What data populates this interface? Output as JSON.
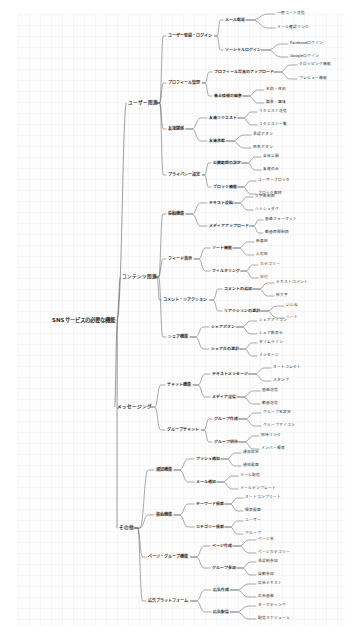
{
  "document": {
    "type": "mindmap",
    "title": "SNSサービスの必要な機能",
    "background_color": "#fdfdfd",
    "line_color": "#4a4a4a",
    "text_color": "#2b2b2b"
  },
  "root": {
    "label": "SNSサービスの必要な機能",
    "x": 52,
    "y": 321
  },
  "branches": [
    {
      "id": "user",
      "label": "ユーザー関連",
      "x": 128,
      "y": 103,
      "children": [
        {
          "label": "ユーザー登録・ログイン",
          "x": 168,
          "y": 36,
          "children": [
            {
              "label": "メール認証",
              "x": 225,
              "y": 20,
              "children": [
                {
                  "label": "一時コード送信",
                  "x": 277,
                  "y": 14
                },
                {
                  "label": "メール確認リンク",
                  "x": 277,
                  "y": 28
                }
              ]
            },
            {
              "label": "ソーシャルログイン",
              "x": 225,
              "y": 50,
              "children": [
                {
                  "label": "Facebookログイン",
                  "x": 290,
                  "y": 44
                },
                {
                  "label": "Googleログイン",
                  "x": 290,
                  "y": 57
                }
              ]
            }
          ]
        },
        {
          "label": "プロフィール管理",
          "x": 168,
          "y": 83,
          "children": [
            {
              "label": "プロフィール写真のアップロード",
              "x": 214,
              "y": 72,
              "children": [
                {
                  "label": "クロッピング機能",
                  "x": 299,
                  "y": 65
                },
                {
                  "label": "プレビュー機能",
                  "x": 299,
                  "y": 79
                }
              ]
            },
            {
              "label": "基本情報の編集",
              "x": 214,
              "y": 96,
              "children": [
                {
                  "label": "名前・性別",
                  "x": 266,
                  "y": 90
                },
                {
                  "label": "職業・趣味",
                  "x": 266,
                  "y": 103
                }
              ]
            }
          ]
        },
        {
          "label": "友達関係",
          "x": 168,
          "y": 129,
          "children": [
            {
              "label": "友達リクエスト",
              "x": 209,
              "y": 118,
              "children": [
                {
                  "label": "リクエスト送信",
                  "x": 259,
                  "y": 112
                },
                {
                  "label": "リクエスト一覧",
                  "x": 259,
                  "y": 125
                }
              ]
            },
            {
              "label": "友達承認",
              "x": 209,
              "y": 141,
              "children": [
                {
                  "label": "承認ボタン",
                  "x": 253,
                  "y": 135
                },
                {
                  "label": "拒否ボタン",
                  "x": 253,
                  "y": 148
                }
              ]
            }
          ]
        },
        {
          "label": "プライバシー設定",
          "x": 168,
          "y": 175,
          "children": [
            {
              "label": "公開範囲の設定",
              "x": 213,
              "y": 163,
              "children": [
                {
                  "label": "全体公開",
                  "x": 263,
                  "y": 157
                },
                {
                  "label": "友達のみ",
                  "x": 263,
                  "y": 170
                }
              ]
            },
            {
              "label": "ブロック機能",
              "x": 213,
              "y": 187,
              "children": [
                {
                  "label": "ユーザーブロック",
                  "x": 258,
                  "y": 181
                },
                {
                  "label": "ブロック解除",
                  "x": 258,
                  "y": 194
                }
              ]
            }
          ]
        }
      ]
    },
    {
      "id": "content",
      "label": "コンテンツ関連",
      "x": 122,
      "y": 277,
      "children": [
        {
          "label": "投稿機能",
          "x": 168,
          "y": 214,
          "children": [
            {
              "label": "テキスト投稿",
              "x": 209,
              "y": 203,
              "children": [
                {
                  "label": "文字数制限",
                  "x": 255,
                  "y": 197
                },
                {
                  "label": "ハッシュタグ",
                  "x": 255,
                  "y": 210
                }
              ]
            },
            {
              "label": "メディアアップロード",
              "x": 209,
              "y": 226,
              "children": [
                {
                  "label": "画像フォーマット",
                  "x": 265,
                  "y": 220
                },
                {
                  "label": "動画時間制限",
                  "x": 265,
                  "y": 233
                }
              ]
            }
          ]
        },
        {
          "label": "フィード表示",
          "x": 168,
          "y": 259,
          "children": [
            {
              "label": "ソート機能",
              "x": 212,
              "y": 248,
              "children": [
                {
                  "label": "新着順",
                  "x": 256,
                  "y": 242
                },
                {
                  "label": "人気順",
                  "x": 256,
                  "y": 255
                }
              ]
            },
            {
              "label": "フィルタリング",
              "x": 212,
              "y": 271,
              "children": [
                {
                  "label": "カテゴリー",
                  "x": 260,
                  "y": 265
                },
                {
                  "label": "日付",
                  "x": 260,
                  "y": 278
                }
              ]
            }
          ]
        },
        {
          "label": "コメント・リアクション",
          "x": 163,
          "y": 300,
          "children": [
            {
              "label": "コメントの追加",
              "x": 224,
              "y": 289,
              "children": [
                {
                  "label": "テキストコメント",
                  "x": 276,
                  "y": 283
                },
                {
                  "label": "絵文字",
                  "x": 276,
                  "y": 296
                }
              ]
            },
            {
              "label": "リアクションの選択",
              "x": 224,
              "y": 311,
              "children": [
                {
                  "label": "いいね",
                  "x": 286,
                  "y": 306
                },
                {
                  "label": "ハート",
                  "x": 286,
                  "y": 318
                }
              ]
            }
          ]
        },
        {
          "label": "シェア機能",
          "x": 168,
          "y": 337,
          "children": [
            {
              "label": "シェアボタン",
              "x": 211,
              "y": 327,
              "children": [
                {
                  "label": "シェアアイコン",
                  "x": 259,
                  "y": 321
                },
                {
                  "label": "シェア数表示",
                  "x": 259,
                  "y": 334
                }
              ]
            },
            {
              "label": "シェア先の選択",
              "x": 211,
              "y": 349,
              "children": [
                {
                  "label": "タイムライン",
                  "x": 259,
                  "y": 343
                },
                {
                  "label": "メッセージ",
                  "x": 259,
                  "y": 356
                }
              ]
            }
          ]
        }
      ]
    },
    {
      "id": "messaging",
      "label": "メッセージング",
      "x": 117,
      "y": 407,
      "children": [
        {
          "label": "チャット機能",
          "x": 167,
          "y": 385,
          "children": [
            {
              "label": "テキストメッセージ",
              "x": 212,
              "y": 374,
              "children": [
                {
                  "label": "オートコレクト",
                  "x": 273,
                  "y": 368
                },
                {
                  "label": "スタンプ",
                  "x": 273,
                  "y": 381
                }
              ]
            },
            {
              "label": "メディア送信",
              "x": 212,
              "y": 397,
              "children": [
                {
                  "label": "画像送信",
                  "x": 262,
                  "y": 391
                },
                {
                  "label": "動画送信",
                  "x": 262,
                  "y": 404
                }
              ]
            }
          ]
        },
        {
          "label": "グループチャット",
          "x": 167,
          "y": 430,
          "children": [
            {
              "label": "グループ作成",
              "x": 214,
              "y": 419,
              "children": [
                {
                  "label": "グループ名設定",
                  "x": 263,
                  "y": 413
                },
                {
                  "label": "グループアイコン",
                  "x": 263,
                  "y": 426
                }
              ]
            },
            {
              "label": "グループ招待",
              "x": 214,
              "y": 442,
              "children": [
                {
                  "label": "招待リンク",
                  "x": 261,
                  "y": 436
                },
                {
                  "label": "メンバー検索",
                  "x": 261,
                  "y": 449
                }
              ]
            }
          ]
        }
      ]
    },
    {
      "id": "others",
      "label": "その他",
      "x": 119,
      "y": 528,
      "children": [
        {
          "label": "通知機能",
          "x": 156,
          "y": 470,
          "children": [
            {
              "label": "プッシュ通知",
              "x": 196,
              "y": 459,
              "children": [
                {
                  "label": "通知設定",
                  "x": 243,
                  "y": 453
                },
                {
                  "label": "通知履歴",
                  "x": 243,
                  "y": 466
                }
              ]
            },
            {
              "label": "メール通知",
              "x": 196,
              "y": 482,
              "children": [
                {
                  "label": "メール配信",
                  "x": 240,
                  "y": 476
                },
                {
                  "label": "メールテンプレート",
                  "x": 240,
                  "y": 489
                }
              ]
            }
          ]
        },
        {
          "label": "検索機能",
          "x": 156,
          "y": 515,
          "children": [
            {
              "label": "キーワード検索",
              "x": 196,
              "y": 504,
              "children": [
                {
                  "label": "オートコンプリート",
                  "x": 245,
                  "y": 498
                },
                {
                  "label": "検索履歴",
                  "x": 245,
                  "y": 511
                }
              ]
            },
            {
              "label": "カテゴリー検索",
              "x": 196,
              "y": 527,
              "children": [
                {
                  "label": "ユーザー",
                  "x": 245,
                  "y": 521
                },
                {
                  "label": "グループ",
                  "x": 245,
                  "y": 534
                }
              ]
            }
          ]
        },
        {
          "label": "ページ・グループ機能",
          "x": 148,
          "y": 557,
          "children": [
            {
              "label": "ページ作成",
              "x": 212,
              "y": 546,
              "children": [
                {
                  "label": "ページ名",
                  "x": 258,
                  "y": 540
                },
                {
                  "label": "ページカテゴリー",
                  "x": 258,
                  "y": 553
                }
              ]
            },
            {
              "label": "グループ参加",
              "x": 212,
              "y": 568,
              "children": [
                {
                  "label": "承認制参加",
                  "x": 258,
                  "y": 562
                },
                {
                  "label": "自動参加",
                  "x": 258,
                  "y": 575
                }
              ]
            }
          ]
        },
        {
          "label": "広告プラットフォーム",
          "x": 148,
          "y": 601,
          "children": [
            {
              "label": "広告作成",
              "x": 213,
              "y": 590,
              "children": [
                {
                  "label": "広告テキスト",
                  "x": 258,
                  "y": 584
                },
                {
                  "label": "広告画像",
                  "x": 258,
                  "y": 597
                }
              ]
            },
            {
              "label": "広告配信",
              "x": 213,
              "y": 612,
              "children": [
                {
                  "label": "ターゲティング",
                  "x": 258,
                  "y": 606
                },
                {
                  "label": "配信スケジュール",
                  "x": 258,
                  "y": 619
                }
              ]
            }
          ]
        }
      ]
    }
  ]
}
